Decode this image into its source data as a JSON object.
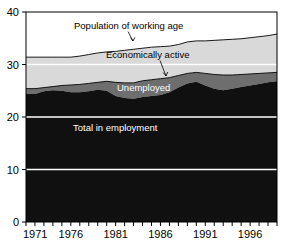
{
  "chart_data": {
    "type": "area",
    "title": "",
    "xlabel": "",
    "ylabel": "",
    "xlim": [
      1971,
      1999
    ],
    "ylim": [
      0,
      40
    ],
    "yticks": [
      0,
      10,
      20,
      30,
      40
    ],
    "xticks": [
      1971,
      1972,
      1973,
      1974,
      1975,
      1976,
      1977,
      1978,
      1979,
      1980,
      1981,
      1982,
      1983,
      1984,
      1985,
      1986,
      1987,
      1988,
      1989,
      1990,
      1991,
      1992,
      1993,
      1994,
      1995,
      1996,
      1997,
      1998,
      1999
    ],
    "xtick_labels": [
      "1971",
      "1976",
      "1981",
      "1986",
      "1991",
      "1996"
    ],
    "xtick_label_years": [
      1971,
      1976,
      1981,
      1986,
      1991,
      1996
    ],
    "ytick_labels": [
      "0",
      "10",
      "20",
      "30",
      "40"
    ],
    "grid": false,
    "legend": "annotations-inline",
    "units": "millions",
    "x": [
      1971,
      1972,
      1973,
      1974,
      1975,
      1976,
      1977,
      1978,
      1979,
      1980,
      1981,
      1982,
      1983,
      1984,
      1985,
      1986,
      1987,
      1988,
      1989,
      1990,
      1991,
      1992,
      1993,
      1994,
      1995,
      1996,
      1997,
      1998,
      1999
    ],
    "series": [
      {
        "name": "Population of working age",
        "color": "#ffffff",
        "boundary": "top-line",
        "values": [
          31.4,
          31.4,
          31.4,
          31.4,
          31.4,
          31.4,
          31.6,
          31.9,
          32.2,
          32.4,
          32.5,
          32.7,
          32.9,
          33.1,
          33.3,
          33.4,
          33.5,
          33.8,
          34.3,
          34.5,
          34.5,
          34.6,
          34.7,
          34.8,
          34.9,
          35.1,
          35.3,
          35.5,
          35.8
        ]
      },
      {
        "name": "Economically active",
        "color": "#d9d9d9",
        "values": [
          25.4,
          25.4,
          25.6,
          25.8,
          26.0,
          26.1,
          26.2,
          26.4,
          26.6,
          26.8,
          26.6,
          26.5,
          26.5,
          26.9,
          27.1,
          27.3,
          27.5,
          27.9,
          28.3,
          28.5,
          28.3,
          28.1,
          28.0,
          28.0,
          28.1,
          28.2,
          28.3,
          28.4,
          28.5
        ]
      },
      {
        "name": "Unemployed",
        "color": "#6e6e6e",
        "values": [
          0.9,
          1.0,
          0.7,
          0.7,
          1.0,
          1.4,
          1.5,
          1.5,
          1.4,
          1.8,
          2.6,
          2.9,
          3.0,
          3.1,
          3.1,
          3.1,
          2.8,
          2.3,
          1.9,
          1.8,
          2.3,
          2.7,
          2.9,
          2.6,
          2.4,
          2.2,
          2.0,
          1.8,
          1.7
        ]
      },
      {
        "name": "Total in employment",
        "color": "#101010",
        "values": [
          24.5,
          24.4,
          24.9,
          25.1,
          25.0,
          24.7,
          24.7,
          24.9,
          25.2,
          25.0,
          24.0,
          23.6,
          23.5,
          23.8,
          24.0,
          24.2,
          24.7,
          25.6,
          26.4,
          26.7,
          26.0,
          25.4,
          25.1,
          25.4,
          25.7,
          26.0,
          26.3,
          26.6,
          26.8
        ]
      }
    ],
    "annotations": [
      {
        "id": "population-of-working-age",
        "text": "Population of working age",
        "style": "dark",
        "anchor_year": 1982,
        "anchor_value": 32.8
      },
      {
        "id": "economically-active",
        "text": "Economically active",
        "style": "dark",
        "anchor_year": 1987,
        "anchor_value": 27.6
      },
      {
        "id": "unemployed",
        "text": "Unemployed",
        "style": "light",
        "anchor_year": 1984,
        "anchor_value": 26.0
      },
      {
        "id": "total-in-employment",
        "text": "Total in employment",
        "style": "light",
        "anchor_year": 1980,
        "anchor_value": 17.0
      }
    ]
  },
  "colors": {
    "background": "#ffffff",
    "axis": "#000000",
    "population_band": "#ffffff",
    "active_band": "#d9d9d9",
    "unemployed_band": "#6e6e6e",
    "employment_band": "#101010",
    "gridline": "#ffffff",
    "text_dark": "#000000",
    "text_light": "#ffffff"
  },
  "axes": {
    "y_tick_values": [
      "40",
      "30",
      "20",
      "10",
      "0"
    ],
    "x_tick_values": [
      "1971",
      "1976",
      "1981",
      "1986",
      "1991",
      "1996"
    ]
  }
}
